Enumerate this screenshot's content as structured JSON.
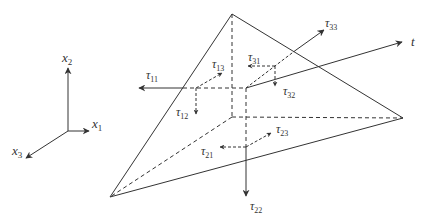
{
  "axes": {
    "x1": {
      "base": "x",
      "sub": "1"
    },
    "x2": {
      "base": "x",
      "sub": "2"
    },
    "x3": {
      "base": "x",
      "sub": "3"
    }
  },
  "traction": {
    "label": "t"
  },
  "stress_components": {
    "t11": {
      "base": "τ",
      "sub": "11"
    },
    "t12": {
      "base": "τ",
      "sub": "12"
    },
    "t13": {
      "base": "τ",
      "sub": "13"
    },
    "t21": {
      "base": "τ",
      "sub": "21"
    },
    "t22": {
      "base": "τ",
      "sub": "22"
    },
    "t23": {
      "base": "τ",
      "sub": "23"
    },
    "t31": {
      "base": "τ",
      "sub": "31"
    },
    "t32": {
      "base": "τ",
      "sub": "32"
    },
    "t33": {
      "base": "τ",
      "sub": "33"
    }
  },
  "colors": {
    "line": "#333333",
    "background": "#ffffff"
  }
}
